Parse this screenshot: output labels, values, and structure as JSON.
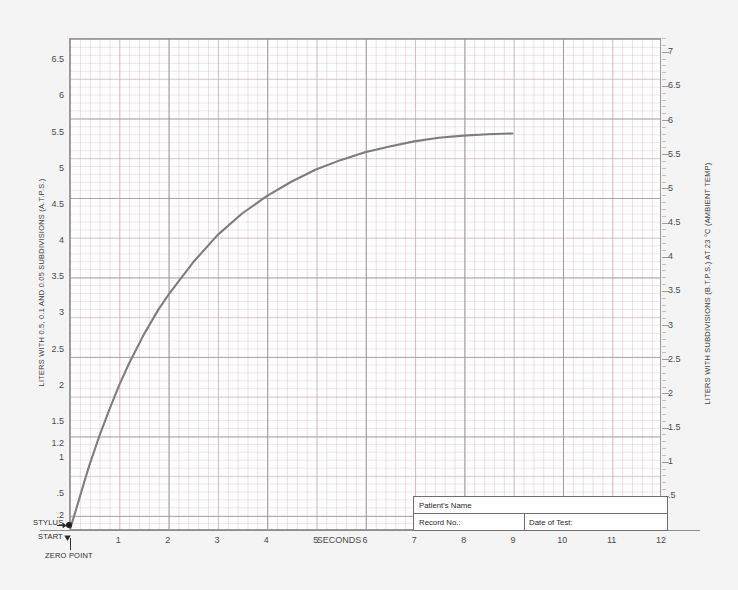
{
  "chart_data": {
    "type": "line",
    "title": "",
    "xlabel": "SECONDS",
    "ylabel": "LITERS WITH 0.5, 0.1 AND 0.05 SUBDIVISIONS (A.T.P.S.)",
    "y2label": "LITERS WITH SUBDIVISIONS (B.T.P.S.) AT 23 °C (AMBIENT TEMP)",
    "xlim": [
      0,
      12
    ],
    "ylim": [
      0,
      6.8
    ],
    "y2lim": [
      0,
      7.2
    ],
    "grid": true,
    "legend": "none",
    "x_ticks": [
      "1",
      "2",
      "3",
      "4",
      "5",
      "6",
      "7",
      "8",
      "9",
      "10",
      "11",
      "12"
    ],
    "y_ticks_left": [
      "6.5",
      "6",
      "5.5",
      "5",
      "4.5",
      "4",
      "3.5",
      "3",
      "2.5",
      "2",
      "1.5",
      "1.2",
      "1",
      ".5",
      ".2"
    ],
    "y_ticks_right": [
      "7",
      "6.5",
      "6",
      "5.5",
      "5",
      "4.5",
      "4",
      "3.5",
      "3",
      "2.5",
      "2",
      "1.5",
      "1",
      ".5"
    ],
    "series": [
      {
        "name": "Spirogram volume-time curve",
        "color": "#7d7d7d",
        "x": [
          0,
          0.1,
          0.2,
          0.3,
          0.4,
          0.5,
          0.6,
          0.8,
          1.0,
          1.2,
          1.5,
          1.8,
          2.0,
          2.5,
          3.0,
          3.5,
          4.0,
          4.5,
          5.0,
          5.5,
          6.0,
          6.5,
          7.0,
          7.5,
          8.0,
          8.5,
          9.0
        ],
        "y": [
          0.0,
          0.22,
          0.45,
          0.68,
          0.9,
          1.1,
          1.3,
          1.66,
          2.0,
          2.3,
          2.7,
          3.05,
          3.25,
          3.7,
          4.08,
          4.38,
          4.62,
          4.82,
          4.99,
          5.12,
          5.23,
          5.31,
          5.38,
          5.43,
          5.46,
          5.48,
          5.49
        ]
      }
    ],
    "annotations": [
      {
        "name": "stylus",
        "text": "STYLUS"
      },
      {
        "name": "start",
        "text": "START"
      },
      {
        "name": "zero-point",
        "text": "ZERO POINT"
      }
    ]
  },
  "axes": {
    "left_title": "LITERS WITH 0.5, 0.1 AND 0.05 SUBDIVISIONS (A.T.P.S.)",
    "right_title": "LITERS WITH SUBDIVISIONS (B.T.P.S.) AT 23 °C (AMBIENT TEMP)",
    "x_title": "SECONDS"
  },
  "annotations": {
    "stylus": "STYLUS",
    "start": "START",
    "zero_point": "ZERO POINT"
  },
  "info_box": {
    "patient_name_label": "Patient's Name",
    "record_no_label": "Record No.:",
    "date_of_test_label": "Date of Test:"
  },
  "colors": {
    "curve": "#7d7d7d",
    "grid_major": "#8c8c91",
    "grid_minor": "#d2aab4",
    "page_background": "#f4f4f4",
    "plot_background": "#ffffff",
    "frame": "#9a9a9a"
  }
}
